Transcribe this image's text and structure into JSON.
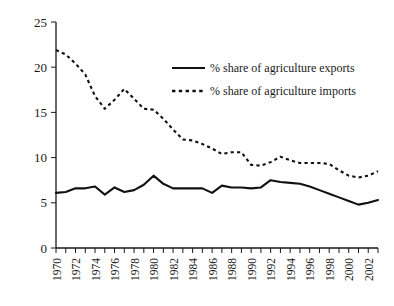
{
  "chart_data": {
    "type": "line",
    "title": "",
    "subtitle": "",
    "xlabel": "",
    "ylabel": "",
    "xlim": [
      1970,
      2003
    ],
    "ylim": [
      0,
      25
    ],
    "yticks": [
      0,
      5,
      10,
      15,
      20,
      25
    ],
    "ytick_labels": [
      "0",
      "5",
      "10",
      "15",
      "20",
      "25"
    ],
    "x": [
      1970,
      1971,
      1972,
      1973,
      1974,
      1975,
      1976,
      1977,
      1978,
      1979,
      1980,
      1981,
      1982,
      1983,
      1984,
      1985,
      1986,
      1987,
      1988,
      1989,
      1990,
      1991,
      1992,
      1993,
      1994,
      1995,
      1996,
      1997,
      1998,
      1999,
      2000,
      2001,
      2002,
      2003
    ],
    "xtick_labels": [
      "1970",
      "1972",
      "1974",
      "1976",
      "1978",
      "1980",
      "1982",
      "1984",
      "1986",
      "1988",
      "1990",
      "1992",
      "1994",
      "1996",
      "1998",
      "2000",
      "2002"
    ],
    "xtick_label_rotation": -90,
    "xtick_interval_years": 2,
    "minor_tick_interval_years": 1,
    "grid": false,
    "legend_position": "upper-center",
    "series": [
      {
        "name": "% share of agriculture exports",
        "style": "solid",
        "values": [
          6.1,
          6.2,
          6.6,
          6.6,
          6.8,
          5.9,
          6.7,
          6.2,
          6.4,
          7.0,
          8.0,
          7.1,
          6.6,
          6.6,
          6.6,
          6.6,
          6.1,
          6.9,
          6.7,
          6.7,
          6.6,
          6.7,
          7.5,
          7.3,
          7.2,
          7.1,
          6.8,
          6.4,
          6.0,
          5.6,
          5.2,
          4.8,
          5.0,
          5.3
        ]
      },
      {
        "name": "% share of agriculture imports",
        "style": "dashed",
        "values": [
          21.9,
          21.4,
          20.4,
          19.2,
          16.8,
          15.4,
          16.4,
          17.6,
          16.5,
          15.4,
          15.3,
          14.3,
          13.1,
          12.0,
          11.9,
          11.5,
          11.0,
          10.4,
          10.6,
          10.6,
          9.2,
          9.1,
          9.5,
          10.1,
          9.7,
          9.4,
          9.4,
          9.4,
          9.3,
          8.6,
          8.0,
          7.8,
          8.0,
          8.5
        ]
      }
    ]
  },
  "legend": {
    "items": [
      {
        "label": "% share of agriculture exports",
        "style": "solid"
      },
      {
        "label": "% share of agriculture imports",
        "style": "dashed"
      }
    ]
  }
}
